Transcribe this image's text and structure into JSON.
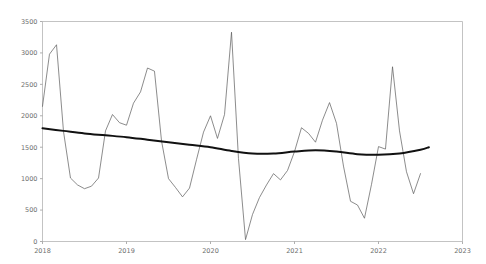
{
  "chart_data": {
    "type": "line",
    "title": "",
    "subtitle": "",
    "xlabel": "",
    "ylabel": "",
    "xlim": [
      2018.0,
      2023.0
    ],
    "ylim": [
      0,
      3500
    ],
    "grid": false,
    "legend": "none",
    "x_tick_labels": [
      "2018",
      "2019",
      "2020",
      "2021",
      "2022",
      "2023"
    ],
    "x_tick_values": [
      2018,
      2019,
      2020,
      2021,
      2022,
      2023
    ],
    "y_tick_labels": [
      "0",
      "500",
      "1000",
      "1500",
      "2000",
      "2500",
      "3000",
      "3500"
    ],
    "y_tick_values": [
      0,
      500,
      1000,
      1500,
      2000,
      2500,
      3000,
      3500
    ],
    "series": [
      {
        "name": "observed",
        "style": "thin-line",
        "color": "#5a5a5a",
        "x": [
          2018.0,
          2018.083,
          2018.167,
          2018.25,
          2018.333,
          2018.417,
          2018.5,
          2018.583,
          2018.667,
          2018.75,
          2018.833,
          2018.917,
          2019.0,
          2019.083,
          2019.167,
          2019.25,
          2019.333,
          2019.417,
          2019.5,
          2019.583,
          2019.667,
          2019.75,
          2019.833,
          2019.917,
          2020.0,
          2020.083,
          2020.167,
          2020.25,
          2020.333,
          2020.417,
          2020.5,
          2020.583,
          2020.667,
          2020.75,
          2020.833,
          2020.917,
          2021.0,
          2021.083,
          2021.167,
          2021.25,
          2021.333,
          2021.417,
          2021.5,
          2021.583,
          2021.667,
          2021.75,
          2021.833,
          2021.917,
          2022.0,
          2022.083,
          2022.167,
          2022.25,
          2022.333,
          2022.417,
          2022.5
        ],
        "values": [
          2150,
          2980,
          3130,
          1750,
          1010,
          900,
          840,
          880,
          1010,
          1760,
          2020,
          1890,
          1850,
          2200,
          2380,
          2760,
          2710,
          1600,
          1000,
          860,
          710,
          850,
          1300,
          1740,
          2000,
          1640,
          2020,
          3330,
          1320,
          30,
          430,
          700,
          900,
          1080,
          980,
          1130,
          1430,
          1810,
          1720,
          1580,
          1930,
          2210,
          1880,
          1200,
          640,
          580,
          370,
          910,
          1510,
          1470,
          2780,
          1760,
          1110,
          760,
          1080
        ]
      },
      {
        "name": "trend",
        "style": "thick-line",
        "color": "#111111",
        "x": [
          2018.0,
          2018.25,
          2018.5,
          2018.75,
          2019.0,
          2019.25,
          2019.5,
          2019.75,
          2020.0,
          2020.25,
          2020.5,
          2020.75,
          2021.0,
          2021.25,
          2021.5,
          2021.75,
          2022.0,
          2022.25,
          2022.5,
          2022.6
        ],
        "values": [
          1800,
          1760,
          1720,
          1690,
          1660,
          1620,
          1580,
          1540,
          1500,
          1440,
          1400,
          1400,
          1430,
          1450,
          1430,
          1390,
          1380,
          1400,
          1460,
          1500
        ]
      }
    ]
  }
}
